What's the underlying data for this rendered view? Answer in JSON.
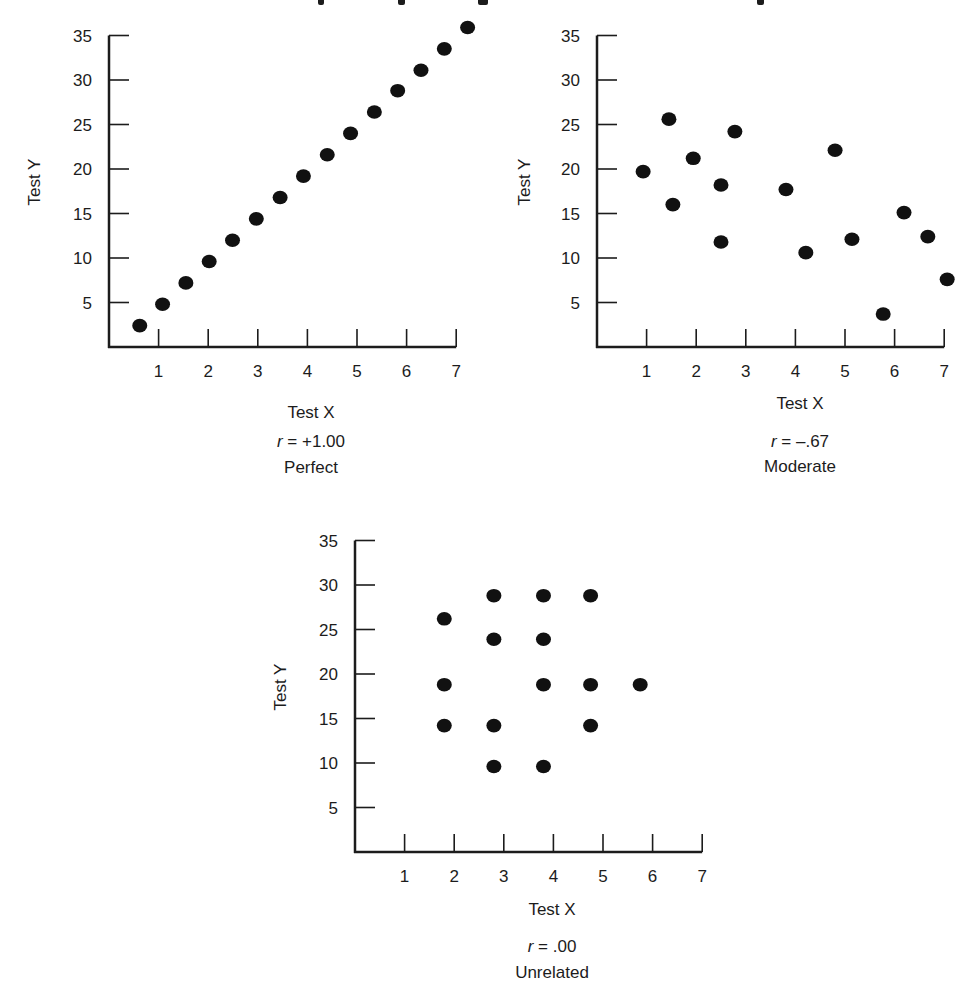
{
  "figure": {
    "title_visible": false
  },
  "chart_data": [
    {
      "id": "perfect",
      "type": "scatter",
      "title": "",
      "xlabel": "Test X",
      "ylabel": "Test Y",
      "xlim": [
        0,
        7
      ],
      "ylim": [
        0,
        35
      ],
      "x_ticks": [
        1,
        2,
        3,
        4,
        5,
        6,
        7
      ],
      "y_ticks": [
        5,
        10,
        15,
        20,
        25,
        30,
        35
      ],
      "grid": false,
      "legend": null,
      "annotation_r": "r = +1.00",
      "annotation_r_symbol": "r",
      "annotation_r_value": " = +1.00",
      "annotation_label": "Perfect",
      "points": [
        [
          0.62,
          2.4
        ],
        [
          1.08,
          4.8
        ],
        [
          1.55,
          7.2
        ],
        [
          2.02,
          9.6
        ],
        [
          2.49,
          12.0
        ],
        [
          2.97,
          14.4
        ],
        [
          3.45,
          16.8
        ],
        [
          3.92,
          19.2
        ],
        [
          4.4,
          21.6
        ],
        [
          4.87,
          24.0
        ],
        [
          5.35,
          26.4
        ],
        [
          5.82,
          28.8
        ],
        [
          6.29,
          31.1
        ],
        [
          6.76,
          33.5
        ],
        [
          7.23,
          35.9
        ]
      ]
    },
    {
      "id": "moderate",
      "type": "scatter",
      "title": "",
      "xlabel": "Test X",
      "ylabel": "Test Y",
      "xlim": [
        0,
        7
      ],
      "ylim": [
        0,
        35
      ],
      "x_ticks": [
        1,
        2,
        3,
        4,
        5,
        6,
        7
      ],
      "y_ticks": [
        5,
        10,
        15,
        20,
        25,
        30,
        35
      ],
      "grid": false,
      "legend": null,
      "annotation_r": "r = –.67",
      "annotation_r_symbol": "r",
      "annotation_r_value": " = –.67",
      "annotation_label": "Moderate",
      "points": [
        [
          0.93,
          19.7
        ],
        [
          1.45,
          25.6
        ],
        [
          1.53,
          16.0
        ],
        [
          1.94,
          21.2
        ],
        [
          2.5,
          18.2
        ],
        [
          2.5,
          11.8
        ],
        [
          2.78,
          24.2
        ],
        [
          3.81,
          17.7
        ],
        [
          4.21,
          10.6
        ],
        [
          4.8,
          22.1
        ],
        [
          5.14,
          12.1
        ],
        [
          5.77,
          3.7
        ],
        [
          6.19,
          15.1
        ],
        [
          6.67,
          12.4
        ],
        [
          7.06,
          7.6
        ]
      ]
    },
    {
      "id": "unrelated",
      "type": "scatter",
      "title": "",
      "xlabel": "Test X",
      "ylabel": "Test Y",
      "xlim": [
        0,
        7
      ],
      "ylim": [
        0,
        35
      ],
      "x_ticks": [
        1,
        2,
        3,
        4,
        5,
        6,
        7
      ],
      "y_ticks": [
        5,
        10,
        15,
        20,
        25,
        30,
        35
      ],
      "grid": false,
      "legend": null,
      "annotation_r": "r = .00",
      "annotation_r_symbol": "r",
      "annotation_r_value": " = .00",
      "annotation_label": "Unrelated",
      "points": [
        [
          1.8,
          26.2
        ],
        [
          2.8,
          28.8
        ],
        [
          3.8,
          28.8
        ],
        [
          4.75,
          28.8
        ],
        [
          2.8,
          23.9
        ],
        [
          3.8,
          23.9
        ],
        [
          1.8,
          18.8
        ],
        [
          3.8,
          18.8
        ],
        [
          4.75,
          18.8
        ],
        [
          5.75,
          18.8
        ],
        [
          1.8,
          14.2
        ],
        [
          2.8,
          14.2
        ],
        [
          4.75,
          14.2
        ],
        [
          2.8,
          9.6
        ],
        [
          3.8,
          9.6
        ]
      ]
    }
  ]
}
